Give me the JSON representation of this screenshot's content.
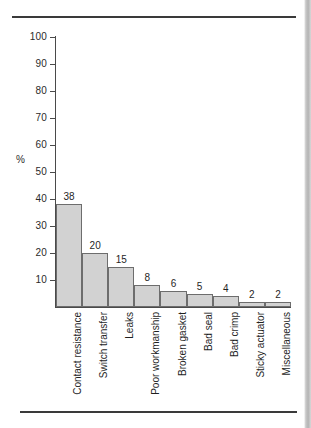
{
  "figure": {
    "y_axis_title": "%",
    "frame": {
      "top_rule": true,
      "bottom_rule": true
    }
  },
  "chart_data": {
    "type": "bar",
    "title": "",
    "xlabel": "",
    "ylabel": "%",
    "ylim": [
      0,
      100
    ],
    "ytick_step": 10,
    "yticks": [
      100,
      90,
      80,
      70,
      60,
      50,
      40,
      30,
      20,
      10
    ],
    "ytick_labels": [
      "100",
      "90",
      "80",
      "70",
      "60",
      "50",
      "40",
      "30",
      "20",
      "10"
    ],
    "grid": false,
    "legend": null,
    "bar_color": "#d2d2d2",
    "bar_edge_color": "#6d6d6d",
    "data_labels": true,
    "categories": [
      "Contact resistance",
      "Switch transfer",
      "Leaks",
      "Poor workmanship",
      "Broken gasket",
      "Bad seal",
      "Bad crimp",
      "Sticky actuator",
      "Miscellaneous"
    ],
    "values": [
      38,
      20,
      15,
      8,
      6,
      5,
      4,
      2,
      2
    ],
    "value_labels": [
      "38",
      "20",
      "15",
      "8",
      "6",
      "5",
      "4",
      "2",
      "2"
    ]
  }
}
